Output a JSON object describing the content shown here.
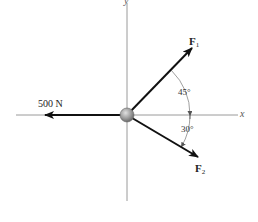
{
  "diagram": {
    "type": "free-body force diagram",
    "axes": {
      "x_label": "x",
      "y_label": "y",
      "color": "#9a9a9a"
    },
    "particle": {
      "name": "particle",
      "fill": "#9d9d9d"
    },
    "forces": [
      {
        "name": "500 N",
        "label": "500 N",
        "direction": "negative x-axis",
        "angle_deg": 180
      },
      {
        "name": "F1",
        "label_main": "F",
        "label_sub": "1",
        "angle_from_x_deg": 45,
        "direction": "up-right"
      },
      {
        "name": "F2",
        "label_main": "F",
        "label_sub": "2",
        "angle_from_x_deg": -30,
        "direction": "down-right"
      }
    ],
    "angles": [
      {
        "label": "45°",
        "between": "F1 and x-axis"
      },
      {
        "label": "30°",
        "between": "F2 and x-axis"
      }
    ],
    "colors": {
      "force_arrow": "#111111",
      "axis": "#9a9a9a",
      "text": "#222222"
    }
  }
}
